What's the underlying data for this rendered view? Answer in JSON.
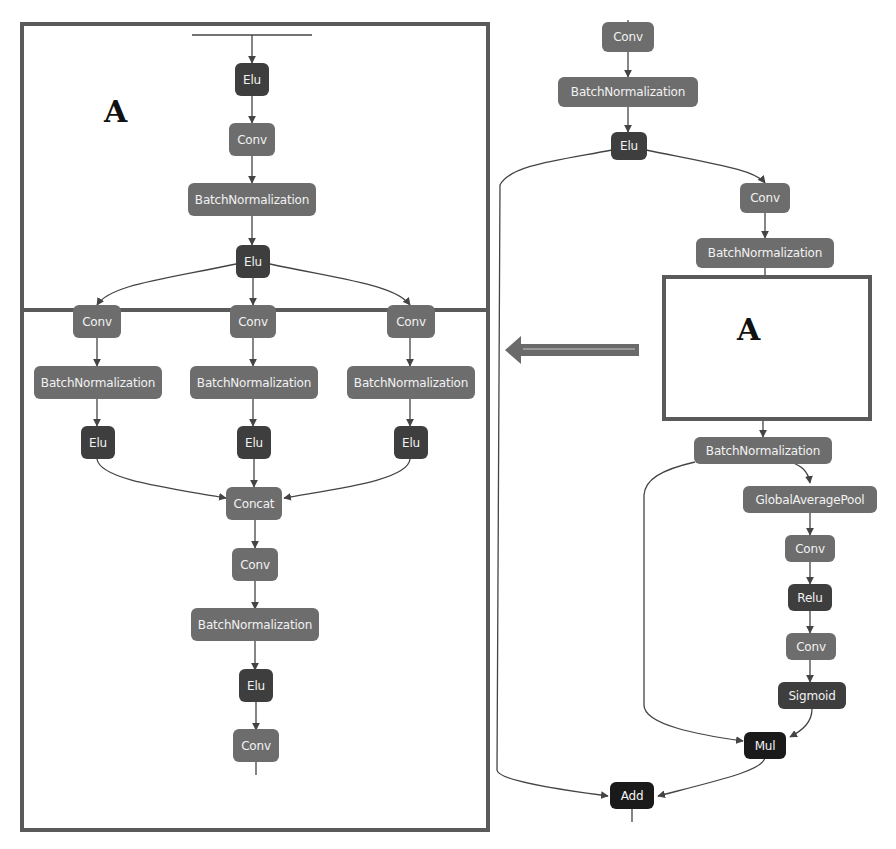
{
  "diagram": {
    "colors": {
      "conv_bn": "#6d6d6d",
      "activation": "#3e3e3e",
      "merge": "#1a1a1a",
      "frame": "#5a5a5a",
      "edge": "#444444"
    },
    "panel_a": {
      "label": "A",
      "nodes": {
        "elu_top": "Elu",
        "conv_1": "Conv",
        "bn_1": "BatchNormalization",
        "elu_split": "Elu",
        "conv_left": "Conv",
        "conv_mid": "Conv",
        "conv_right": "Conv",
        "bn_left": "BatchNormalization",
        "bn_mid": "BatchNormalization",
        "bn_right": "BatchNormalization",
        "elu_left": "Elu",
        "elu_mid": "Elu",
        "elu_right": "Elu",
        "concat": "Concat",
        "conv_2": "Conv",
        "bn_2": "BatchNormalization",
        "elu_2": "Elu",
        "conv_out": "Conv"
      }
    },
    "main": {
      "placeholder_label": "A",
      "arrow": "left-arrow",
      "nodes": {
        "conv_top": "Conv",
        "bn_top": "BatchNormalization",
        "elu_top": "Elu",
        "conv_1": "Conv",
        "bn_1": "BatchNormalization",
        "bn_after_a": "BatchNormalization",
        "gap": "GlobalAveragePool",
        "se_conv_1": "Conv",
        "relu": "Relu",
        "se_conv_2": "Conv",
        "sigmoid": "Sigmoid",
        "mul": "Mul",
        "add": "Add"
      }
    }
  }
}
